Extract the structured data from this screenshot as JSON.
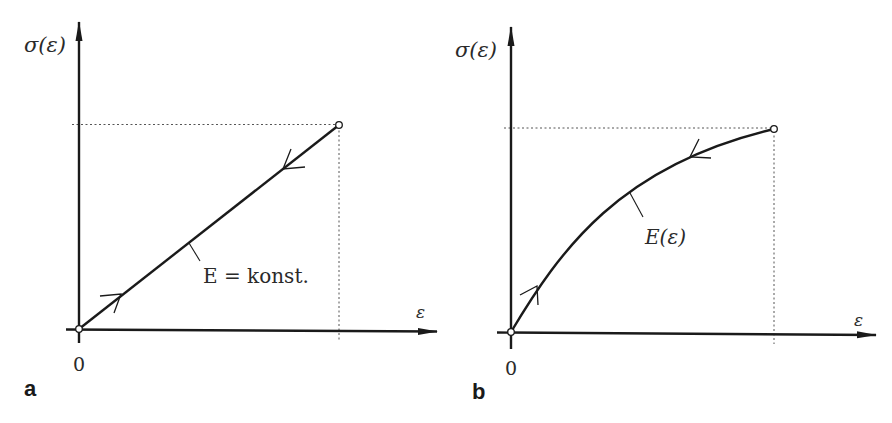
{
  "figure": {
    "panels": [
      {
        "id": "a",
        "panel_label": "a",
        "y_axis_label": "σ(ε)",
        "x_axis_label": "ε",
        "origin_label": "0",
        "curve_label": "E = konst.",
        "curve_type": "linear",
        "loading_direction": "up (origin to end point)",
        "unloading_direction": "down (end point to origin)"
      },
      {
        "id": "b",
        "panel_label": "b",
        "y_axis_label": "σ(ε)",
        "x_axis_label": "ε",
        "origin_label": "0",
        "curve_label": "E(ε)",
        "curve_type": "concave nonlinear",
        "loading_direction": "up (origin to end point)",
        "unloading_direction": "down (end point to origin)"
      }
    ],
    "colors": {
      "line": "#1a1a1a",
      "guide": "#555555",
      "background": "#ffffff"
    }
  }
}
